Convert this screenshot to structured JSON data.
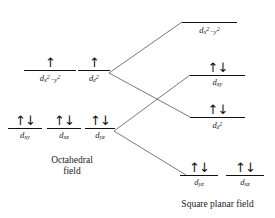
{
  "diagram": {
    "title_left": "Octahedral field",
    "title_right": "Square planar field",
    "arrow_pair": "↑↓",
    "arrow_single": "↑"
  },
  "captions": {
    "left_line1": "Octahedral",
    "left_line2": "field",
    "right": "Square planar field"
  },
  "octahedral": {
    "eg": [
      {
        "name": "dx2-y2",
        "base": "d",
        "sub": "x",
        "sup1": "2",
        "sub_mid": "−y",
        "sup2": "2",
        "electrons": "↑",
        "count": 1
      },
      {
        "name": "dz2",
        "base": "d",
        "sub": "z",
        "sup1": "2",
        "sub_mid": "",
        "sup2": "",
        "electrons": "↑",
        "count": 1
      }
    ],
    "t2g": [
      {
        "name": "dxy",
        "base": "d",
        "sub": "xy",
        "sup1": "",
        "sub_mid": "",
        "sup2": "",
        "electrons": "↑↓",
        "count": 2
      },
      {
        "name": "dxz",
        "base": "d",
        "sub": "xz",
        "sup1": "",
        "sub_mid": "",
        "sup2": "",
        "electrons": "↑↓",
        "count": 2
      },
      {
        "name": "dyz",
        "base": "d",
        "sub": "yz",
        "sup1": "",
        "sub_mid": "",
        "sup2": "",
        "electrons": "↑↓",
        "count": 2
      }
    ]
  },
  "square_planar": {
    "levels": [
      {
        "name": "dx2-y2",
        "base": "d",
        "sub": "x",
        "sup1": "2",
        "sub_mid": "−y",
        "sup2": "2",
        "electrons": "",
        "count": 0
      },
      {
        "name": "dxy",
        "base": "d",
        "sub": "xy",
        "sup1": "",
        "sub_mid": "",
        "sup2": "",
        "electrons": "↑↓",
        "count": 2
      },
      {
        "name": "dz2",
        "base": "d",
        "sub": "z",
        "sup1": "2",
        "sub_mid": "",
        "sup2": "",
        "electrons": "↑↓",
        "count": 2
      },
      {
        "name": "dyz",
        "base": "d",
        "sub": "yz",
        "sup1": "",
        "sub_mid": "",
        "sup2": "",
        "electrons": "↑↓",
        "count": 2
      },
      {
        "name": "dxz",
        "base": "d",
        "sub": "xz",
        "sup1": "",
        "sub_mid": "",
        "sup2": "",
        "electrons": "↑↓",
        "count": 2
      }
    ]
  },
  "colors": {
    "line": "#111111",
    "connector": "#555555",
    "text": "#222222",
    "background": "#ffffff"
  }
}
